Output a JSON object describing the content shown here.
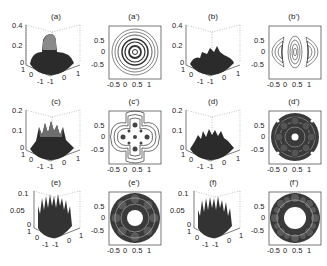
{
  "figure": {
    "panels": [
      {
        "id": "a",
        "label": "(a)",
        "type": "surface3d",
        "zticks": [
          "0.4",
          "0.2",
          "0"
        ],
        "xticks": [
          "-1",
          "0",
          "1"
        ],
        "yticks": [
          "1",
          "0",
          "-1"
        ]
      },
      {
        "id": "a'",
        "label": "(a')",
        "type": "contour",
        "yticks": [
          "0.5",
          "0",
          "-0.5"
        ],
        "xticks": [
          "-0.5",
          "0",
          "0.5",
          "1"
        ],
        "pattern": "concentric-rings"
      },
      {
        "id": "b",
        "label": "(b)",
        "type": "surface3d",
        "zticks": [
          "0.4",
          "0.2",
          "0"
        ],
        "xticks": [
          "-1",
          "0",
          "1"
        ],
        "yticks": [
          "1",
          "0",
          "-1"
        ]
      },
      {
        "id": "b'",
        "label": "(b')",
        "type": "contour",
        "yticks": [
          "0.5",
          "0",
          "-0.5"
        ],
        "xticks": [
          "-0.5",
          "0",
          "0.5",
          "1"
        ],
        "pattern": "three-lobes-horizontal"
      },
      {
        "id": "c",
        "label": "(c)",
        "type": "surface3d",
        "zticks": [
          "0.2",
          "0.1",
          "0"
        ],
        "xticks": [
          "-1",
          "0",
          "1"
        ],
        "yticks": [
          "1",
          "0",
          "-1"
        ]
      },
      {
        "id": "c'",
        "label": "(c')",
        "type": "contour",
        "yticks": [
          "0.5",
          "0",
          "-0.5"
        ],
        "xticks": [
          "-0.5",
          "0",
          "0.5",
          "1"
        ],
        "pattern": "cross-shaped"
      },
      {
        "id": "d",
        "label": "(d)",
        "type": "surface3d",
        "zticks": [
          "0.2",
          "0.1",
          "0"
        ],
        "xticks": [
          "-1",
          "0",
          "1"
        ],
        "yticks": [
          "1",
          "0",
          "-1"
        ]
      },
      {
        "id": "d'",
        "label": "(d')",
        "type": "contour",
        "yticks": [
          "0.5",
          "0",
          "-0.5"
        ],
        "xticks": [
          "-0.5",
          "0",
          "0.5",
          "1"
        ],
        "pattern": "ring-of-lobes"
      },
      {
        "id": "e",
        "label": "(e)",
        "type": "surface3d",
        "zticks": [
          "0.1",
          "0.05",
          "0"
        ],
        "xticks": [
          "-1",
          "0",
          "1"
        ],
        "yticks": [
          "1",
          "0",
          "-1"
        ]
      },
      {
        "id": "e'",
        "label": "(e')",
        "type": "contour",
        "yticks": [
          "0.5",
          "0",
          "-0.5"
        ],
        "xticks": [
          "-0.5",
          "0",
          "0.5",
          "1"
        ],
        "pattern": "ring-of-lobes-hollow-center"
      },
      {
        "id": "f",
        "label": "(f)",
        "type": "surface3d",
        "zticks": [
          "0.1",
          "0.05",
          "0"
        ],
        "xticks": [
          "-1",
          "0",
          "1"
        ],
        "yticks": [
          "1",
          "0",
          "-1"
        ]
      },
      {
        "id": "f'",
        "label": "(f')",
        "type": "contour",
        "yticks": [
          "0.5",
          "0",
          "-0.5"
        ],
        "xticks": [
          "-0.5",
          "0",
          "0.5",
          "1"
        ],
        "pattern": "ring-of-lobes-hollow-center"
      }
    ]
  }
}
